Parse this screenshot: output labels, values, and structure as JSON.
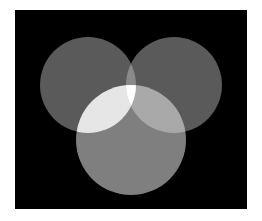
{
  "diagram": {
    "type": "venn",
    "sets": 3,
    "background": {
      "x": 15,
      "y": 10,
      "width": 232,
      "height": 199,
      "color": "#000000"
    },
    "page_background": "#ffffff",
    "circles": [
      {
        "id": "left",
        "cx": 88,
        "cy": 85,
        "r": 48,
        "color": "#5a5a5a"
      },
      {
        "id": "right",
        "cx": 174,
        "cy": 85,
        "r": 48,
        "color": "#5a5a5a"
      },
      {
        "id": "bottom",
        "cx": 131,
        "cy": 140,
        "r": 55,
        "color": "#7f7f7f"
      }
    ],
    "overlaps": {
      "left_right": "#8a8a8a",
      "left_bottom": "#e6e6e6",
      "right_bottom": "#a9a9a9",
      "all_three": "#ffffff"
    },
    "labels": []
  }
}
